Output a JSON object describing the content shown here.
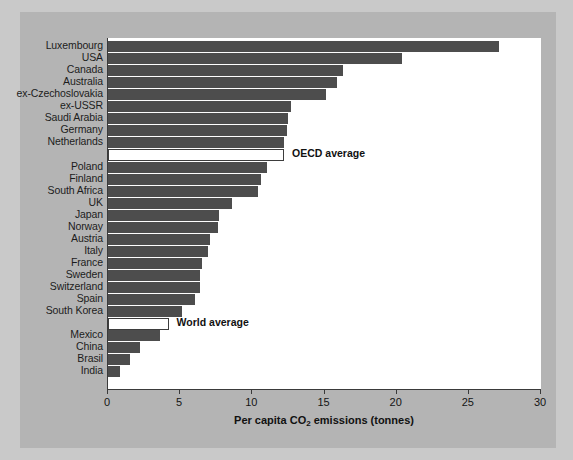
{
  "chart_data": {
    "type": "bar",
    "orientation": "horizontal",
    "title": "",
    "xlabel": "Per capita CO2 emissions (tonnes)",
    "xlabel_parts": {
      "pre": "Per capita CO",
      "sub": "2",
      "post": " emissions (tonnes)"
    },
    "ylabel": "",
    "xlim": [
      0,
      30
    ],
    "xticks": [
      0,
      5,
      10,
      15,
      20,
      25,
      30
    ],
    "xticklabels": [
      "0",
      "5",
      "10",
      "15",
      "20",
      "25",
      "30"
    ],
    "grid": false,
    "legend": "none",
    "bar_color": "#4d4d4d",
    "average_bar_color": "#ffffff",
    "average_bar_border": "#3d3d3d",
    "plot_background": "#ffffff",
    "figure_background": "#b4b4b4",
    "outer_background": "#c9c9c9",
    "categories": [
      "Luxembourg",
      "USA",
      "Canada",
      "Australia",
      "ex-Czechoslovakia",
      "ex-USSR",
      "Saudi Arabia",
      "Germany",
      "Netherlands",
      "OECD average",
      "Poland",
      "Finland",
      "South Africa",
      "UK",
      "Japan",
      "Norway",
      "Austria",
      "Italy",
      "France",
      "Sweden",
      "Switzerland",
      "Spain",
      "South Korea",
      "World average",
      "Mexico",
      "China",
      "Brasil",
      "India"
    ],
    "values": [
      27.1,
      20.4,
      16.3,
      15.9,
      15.1,
      12.7,
      12.5,
      12.4,
      12.2,
      12.2,
      11.0,
      10.6,
      10.4,
      8.6,
      7.7,
      7.6,
      7.1,
      6.9,
      6.5,
      6.4,
      6.4,
      6.0,
      5.1,
      4.2,
      3.6,
      2.2,
      1.5,
      0.8
    ],
    "rows": [
      {
        "label": "Luxembourg",
        "value": 27.1,
        "kind": "bar",
        "annotation": ""
      },
      {
        "label": "USA",
        "value": 20.4,
        "kind": "bar",
        "annotation": ""
      },
      {
        "label": "Canada",
        "value": 16.3,
        "kind": "bar",
        "annotation": ""
      },
      {
        "label": "Australia",
        "value": 15.9,
        "kind": "bar",
        "annotation": ""
      },
      {
        "label": "ex-Czechoslovakia",
        "value": 15.1,
        "kind": "bar",
        "annotation": ""
      },
      {
        "label": "ex-USSR",
        "value": 12.7,
        "kind": "bar",
        "annotation": ""
      },
      {
        "label": "Saudi Arabia",
        "value": 12.5,
        "kind": "bar",
        "annotation": ""
      },
      {
        "label": "Germany",
        "value": 12.4,
        "kind": "bar",
        "annotation": ""
      },
      {
        "label": "Netherlands",
        "value": 12.2,
        "kind": "bar",
        "annotation": ""
      },
      {
        "label": "",
        "value": 12.2,
        "kind": "average",
        "annotation": "OECD average"
      },
      {
        "label": "Poland",
        "value": 11.0,
        "kind": "bar",
        "annotation": ""
      },
      {
        "label": "Finland",
        "value": 10.6,
        "kind": "bar",
        "annotation": ""
      },
      {
        "label": "South Africa",
        "value": 10.4,
        "kind": "bar",
        "annotation": ""
      },
      {
        "label": "UK",
        "value": 8.6,
        "kind": "bar",
        "annotation": ""
      },
      {
        "label": "Japan",
        "value": 7.7,
        "kind": "bar",
        "annotation": ""
      },
      {
        "label": "Norway",
        "value": 7.6,
        "kind": "bar",
        "annotation": ""
      },
      {
        "label": "Austria",
        "value": 7.1,
        "kind": "bar",
        "annotation": ""
      },
      {
        "label": "Italy",
        "value": 6.9,
        "kind": "bar",
        "annotation": ""
      },
      {
        "label": "France",
        "value": 6.5,
        "kind": "bar",
        "annotation": ""
      },
      {
        "label": "Sweden",
        "value": 6.4,
        "kind": "bar",
        "annotation": ""
      },
      {
        "label": "Switzerland",
        "value": 6.4,
        "kind": "bar",
        "annotation": ""
      },
      {
        "label": "Spain",
        "value": 6.0,
        "kind": "bar",
        "annotation": ""
      },
      {
        "label": "South Korea",
        "value": 5.1,
        "kind": "bar",
        "annotation": ""
      },
      {
        "label": "",
        "value": 4.2,
        "kind": "average",
        "annotation": "World average"
      },
      {
        "label": "Mexico",
        "value": 3.6,
        "kind": "bar",
        "annotation": ""
      },
      {
        "label": "China",
        "value": 2.2,
        "kind": "bar",
        "annotation": ""
      },
      {
        "label": "Brasil",
        "value": 1.5,
        "kind": "bar",
        "annotation": ""
      },
      {
        "label": "India",
        "value": 0.8,
        "kind": "bar",
        "annotation": ""
      }
    ]
  }
}
